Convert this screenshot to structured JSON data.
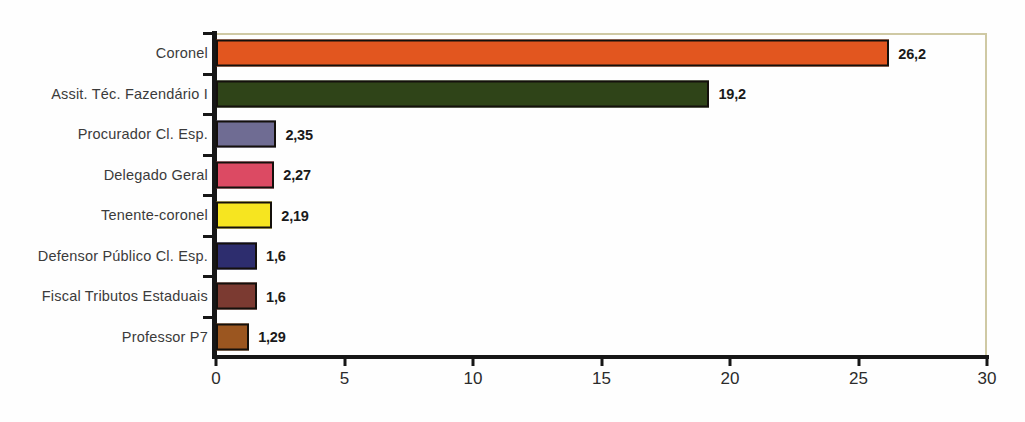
{
  "chart_data": {
    "type": "bar",
    "orientation": "horizontal",
    "title": "",
    "xlabel": "",
    "ylabel": "",
    "xlim": [
      0,
      30
    ],
    "xticks": [
      0,
      5,
      10,
      15,
      20,
      25,
      30
    ],
    "xtick_labels": [
      "0",
      "5",
      "10",
      "15",
      "20",
      "25",
      "30"
    ],
    "grid": false,
    "legend": "none",
    "categories": [
      "Coronel",
      "Assit. Téc. Fazendário I",
      "Procurador Cl. Esp.",
      "Delegado Geral",
      "Tenente-coronel",
      "Defensor Público Cl. Esp.",
      "Fiscal Tributos Estaduais",
      "Professor P7"
    ],
    "values": [
      26.2,
      19.2,
      2.35,
      2.27,
      2.19,
      1.6,
      1.6,
      1.29
    ],
    "value_labels": [
      "26,2",
      "19,2",
      "2,35",
      "2,27",
      "2,19",
      "1,6",
      "1,6",
      "1,29"
    ],
    "colors": [
      "#e2561f",
      "#2f4418",
      "#6f6c93",
      "#dc4a63",
      "#f6e520",
      "#2d2d6e",
      "#7b3a31",
      "#9b5620"
    ],
    "bar_edge_color": "#14100c",
    "frame_color": "#cfc9a4",
    "axis_color": "#161616"
  }
}
